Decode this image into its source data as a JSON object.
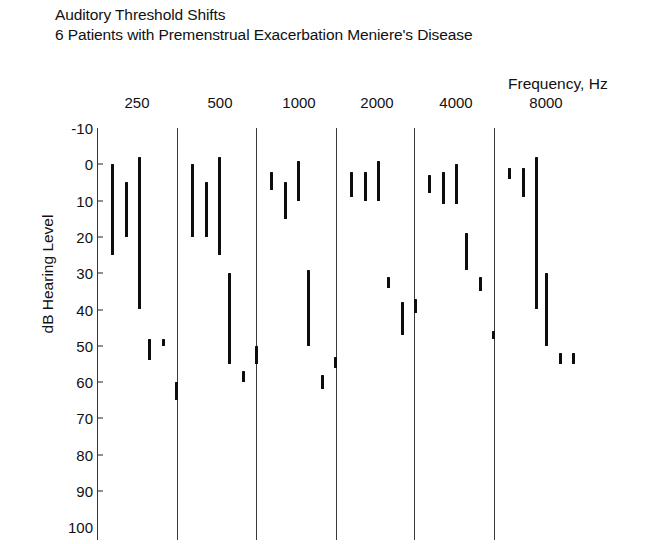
{
  "title": {
    "line1": "Auditory Threshold Shifts",
    "line2": "6 Patients with Premenstrual Exacerbation Meniere's Disease"
  },
  "axes": {
    "x_label": "Frequency, Hz",
    "y_label": "dB Hearing Level"
  },
  "chart_data": {
    "type": "bar",
    "xlabel": "Frequency, Hz",
    "ylabel": "dB Hearing Level",
    "ylim": [
      -10,
      100
    ],
    "y_inverted": true,
    "yticks": [
      -10,
      0,
      10,
      20,
      30,
      40,
      50,
      60,
      70,
      80,
      90,
      100
    ],
    "categories": [
      "250",
      "500",
      "1000",
      "2000",
      "4000",
      "8000"
    ],
    "grid": false,
    "legend": false,
    "note": "Each vertical bar is one patient's threshold shift range (top = better/lower dB value, bottom = worse/higher dB value). 6 patients per frequency group.",
    "series": [
      {
        "name": "250",
        "bars": [
          {
            "patient": 1,
            "from": 0,
            "to": 25
          },
          {
            "patient": 2,
            "from": 5,
            "to": 20
          },
          {
            "patient": 3,
            "from": -2,
            "to": 40
          },
          {
            "patient": 4,
            "from": 48,
            "to": 54
          },
          {
            "patient": 5,
            "from": 48,
            "to": 50
          },
          {
            "patient": 6,
            "from": 60,
            "to": 65
          }
        ]
      },
      {
        "name": "500",
        "bars": [
          {
            "patient": 1,
            "from": 0,
            "to": 20
          },
          {
            "patient": 2,
            "from": 5,
            "to": 20
          },
          {
            "patient": 3,
            "from": -2,
            "to": 25
          },
          {
            "patient": 4,
            "from": 30,
            "to": 55
          },
          {
            "patient": 5,
            "from": 57,
            "to": 60
          },
          {
            "patient": 6,
            "from": 50,
            "to": 55
          }
        ]
      },
      {
        "name": "1000",
        "bars": [
          {
            "patient": 1,
            "from": 2,
            "to": 7
          },
          {
            "patient": 2,
            "from": 5,
            "to": 15
          },
          {
            "patient": 3,
            "from": -1,
            "to": 10
          },
          {
            "patient": 4,
            "from": 29,
            "to": 50
          },
          {
            "patient": 5,
            "from": 58,
            "to": 62
          },
          {
            "patient": 6,
            "from": 53,
            "to": 56
          }
        ]
      },
      {
        "name": "2000",
        "bars": [
          {
            "patient": 1,
            "from": 2,
            "to": 9
          },
          {
            "patient": 2,
            "from": 2,
            "to": 10
          },
          {
            "patient": 3,
            "from": -1,
            "to": 10
          },
          {
            "patient": 4,
            "from": 31,
            "to": 34
          },
          {
            "patient": 5,
            "from": 38,
            "to": 47
          },
          {
            "patient": 6,
            "from": 37,
            "to": 41
          }
        ]
      },
      {
        "name": "4000",
        "bars": [
          {
            "patient": 1,
            "from": 3,
            "to": 8
          },
          {
            "patient": 2,
            "from": 2,
            "to": 11
          },
          {
            "patient": 3,
            "from": 0,
            "to": 11
          },
          {
            "patient": 4,
            "from": 19,
            "to": 29
          },
          {
            "patient": 5,
            "from": 31,
            "to": 35
          },
          {
            "patient": 6,
            "from": 46,
            "to": 48
          }
        ]
      },
      {
        "name": "8000",
        "bars": [
          {
            "patient": 1,
            "from": 1,
            "to": 4
          },
          {
            "patient": 2,
            "from": 1,
            "to": 9
          },
          {
            "patient": 3,
            "from": -2,
            "to": 40
          },
          {
            "patient": 4,
            "from": 30,
            "to": 50
          },
          {
            "patient": 5,
            "from": 52,
            "to": 55
          },
          {
            "patient": 6,
            "from": 52,
            "to": 55
          }
        ]
      }
    ]
  },
  "layout": {
    "plot_left": 97,
    "plot_right": 658,
    "y_top_px": 128,
    "y_top_val": -10,
    "px_per_10db": 36.3,
    "bottom_px": 540,
    "separators_px": [
      97,
      177,
      256,
      336,
      414,
      494
    ],
    "group_label_x_px": [
      137,
      220,
      299,
      377,
      456,
      546
    ],
    "bar_color": "#0d0d0d",
    "separator_color": "#3a3a3a",
    "bar_x_offsets": [
      14,
      28,
      41,
      51,
      65,
      78
    ]
  }
}
